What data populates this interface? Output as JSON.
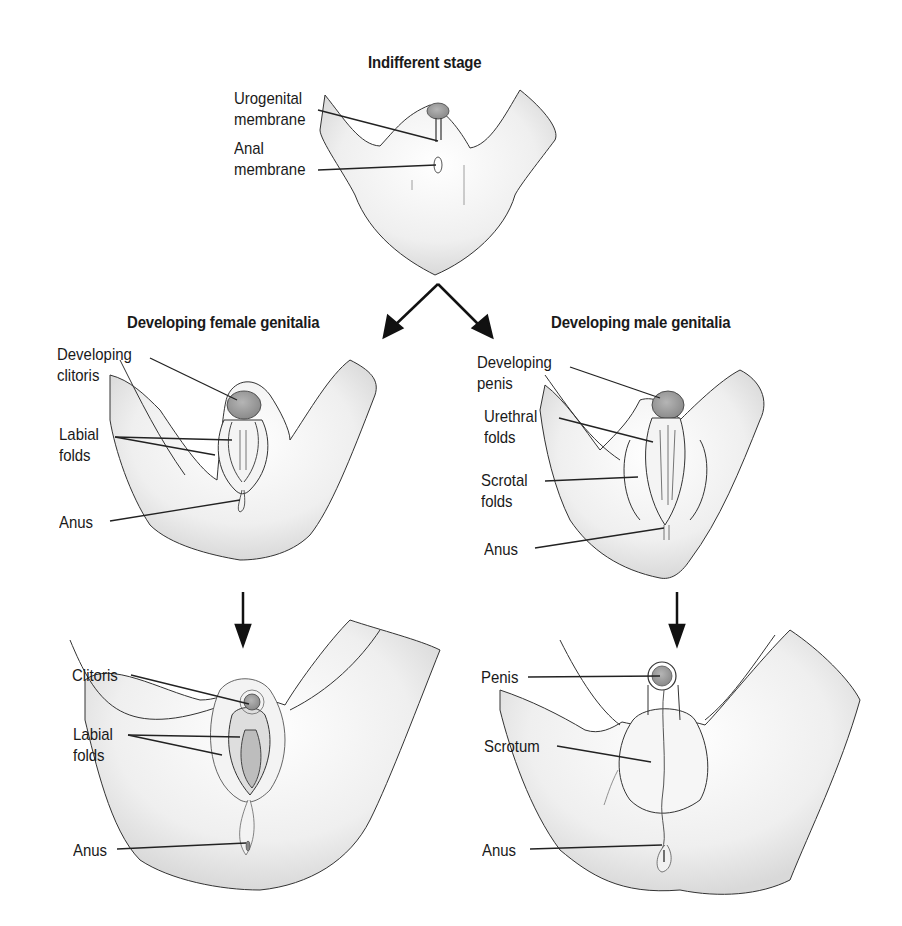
{
  "figure": {
    "panels": {
      "indifferent": {
        "title": "Indifferent stage",
        "labels": [
          "Urogenital\nmembrane",
          "Anal\nmembrane"
        ]
      },
      "female_developing": {
        "title": "Developing female genitalia",
        "labels": [
          "Developing\nclitoris",
          "Labial\nfolds",
          "Anus"
        ]
      },
      "male_developing": {
        "title": "Developing male genitalia",
        "labels": [
          "Developing\npenis",
          "Urethral\nfolds",
          "Scrotal\nfolds",
          "Anus"
        ]
      },
      "female_final": {
        "labels": [
          "Clitoris",
          "Labial\nfolds",
          "Anus"
        ]
      },
      "male_final": {
        "labels": [
          "Penis",
          "Scrotum",
          "Anus"
        ]
      }
    },
    "colors": {
      "line": "#222222",
      "skin": "#f1f1f1",
      "shade": "#c8c8c8",
      "tissue": "#9a9a9a"
    }
  }
}
